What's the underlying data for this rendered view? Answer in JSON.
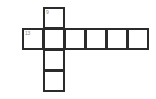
{
  "figure": {
    "kind": "crossword-grid",
    "background_color": "#ffffff",
    "cell_fill_color": "#ffffff",
    "border_color": "#2b2b2b",
    "number_color": "#8a8a8a",
    "width": 156,
    "height": 99
  },
  "grid": {
    "cell_size": 21,
    "origin_x": 22,
    "origin_y": 7,
    "columns": 6,
    "rows": 4,
    "across_entry": {
      "row_index": 1,
      "start_col": 0,
      "length": 6
    },
    "down_entry": {
      "col_index": 1,
      "start_row": 0,
      "length": 4
    }
  },
  "cells": [
    {
      "id": "cell-r0c1",
      "col": 1,
      "row": 0,
      "number": "9",
      "letter": ""
    },
    {
      "id": "cell-r1c0",
      "col": 0,
      "row": 1,
      "number": "13",
      "letter": ""
    },
    {
      "id": "cell-r1c1",
      "col": 1,
      "row": 1,
      "number": "",
      "letter": ""
    },
    {
      "id": "cell-r1c2",
      "col": 2,
      "row": 1,
      "number": "",
      "letter": ""
    },
    {
      "id": "cell-r1c3",
      "col": 3,
      "row": 1,
      "number": "",
      "letter": ""
    },
    {
      "id": "cell-r1c4",
      "col": 4,
      "row": 1,
      "number": "",
      "letter": ""
    },
    {
      "id": "cell-r1c5",
      "col": 5,
      "row": 1,
      "number": "",
      "letter": ""
    },
    {
      "id": "cell-r2c1",
      "col": 1,
      "row": 2,
      "number": "",
      "letter": ""
    },
    {
      "id": "cell-r3c1",
      "col": 1,
      "row": 3,
      "number": "",
      "letter": ""
    }
  ]
}
